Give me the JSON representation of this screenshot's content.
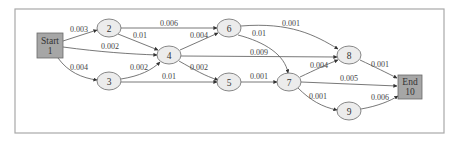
{
  "diagram": {
    "type": "directed-graph",
    "nodes": [
      {
        "id": "1",
        "label_lines": [
          "Start",
          "1"
        ],
        "shape": "box"
      },
      {
        "id": "2",
        "label": "2",
        "shape": "ellipse"
      },
      {
        "id": "3",
        "label": "3",
        "shape": "ellipse"
      },
      {
        "id": "4",
        "label": "4",
        "shape": "ellipse"
      },
      {
        "id": "5",
        "label": "5",
        "shape": "ellipse"
      },
      {
        "id": "6",
        "label": "6",
        "shape": "ellipse"
      },
      {
        "id": "7",
        "label": "7",
        "shape": "ellipse"
      },
      {
        "id": "8",
        "label": "8",
        "shape": "ellipse"
      },
      {
        "id": "9",
        "label": "9",
        "shape": "ellipse"
      },
      {
        "id": "10",
        "label_lines": [
          "End",
          "10"
        ],
        "shape": "box"
      }
    ],
    "edges": [
      {
        "from": "1",
        "to": "2",
        "label": "0.003"
      },
      {
        "from": "1",
        "to": "4",
        "label": "0.002"
      },
      {
        "from": "1",
        "to": "3",
        "label": "0.004"
      },
      {
        "from": "2",
        "to": "6",
        "label": "0.006"
      },
      {
        "from": "2",
        "to": "4",
        "label": "0.01"
      },
      {
        "from": "3",
        "to": "4",
        "label": "0.002"
      },
      {
        "from": "3",
        "to": "5",
        "label": "0.01"
      },
      {
        "from": "4",
        "to": "6",
        "label": "0.004"
      },
      {
        "from": "4",
        "to": "8",
        "label": "0.009"
      },
      {
        "from": "4",
        "to": "5",
        "label": "0.002"
      },
      {
        "from": "6",
        "to": "8",
        "label": "0.001"
      },
      {
        "from": "6",
        "to": "7",
        "label": "0.01"
      },
      {
        "from": "5",
        "to": "7",
        "label": "0.001"
      },
      {
        "from": "7",
        "to": "8",
        "label": "0.004"
      },
      {
        "from": "7",
        "to": "10",
        "label": "0.005"
      },
      {
        "from": "7",
        "to": "9",
        "label": "0.001"
      },
      {
        "from": "8",
        "to": "10",
        "label": "0.001"
      },
      {
        "from": "9",
        "to": "10",
        "label": "0.006"
      }
    ]
  },
  "colors": {
    "box_fill": "#a6a6a6",
    "ellipse_fill": "#ececec",
    "stroke": "#555555",
    "frame": "#a8a8a8"
  }
}
